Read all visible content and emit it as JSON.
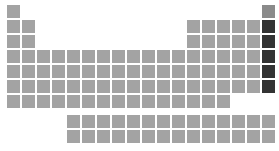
{
  "grid": {
    "origin_x": 7,
    "origin_y": 5,
    "pitch": 15,
    "f_origin_x": 67,
    "f_origin_y": 115,
    "colors": {
      "default": "#a3a3a3",
      "helium": "#8a8a8a",
      "noble": "#333333"
    },
    "rows": [
      {
        "period": 1,
        "cols": [
          1,
          18
        ]
      },
      {
        "period": 2,
        "cols": [
          1,
          2,
          13,
          14,
          15,
          16,
          17,
          18
        ]
      },
      {
        "period": 3,
        "cols": [
          1,
          2,
          13,
          14,
          15,
          16,
          17,
          18
        ]
      },
      {
        "period": 4,
        "cols": [
          1,
          2,
          3,
          4,
          5,
          6,
          7,
          8,
          9,
          10,
          11,
          12,
          13,
          14,
          15,
          16,
          17,
          18
        ]
      },
      {
        "period": 5,
        "cols": [
          1,
          2,
          3,
          4,
          5,
          6,
          7,
          8,
          9,
          10,
          11,
          12,
          13,
          14,
          15,
          16,
          17,
          18
        ]
      },
      {
        "period": 6,
        "cols": [
          1,
          2,
          3,
          4,
          5,
          6,
          7,
          8,
          9,
          10,
          11,
          12,
          13,
          14,
          15,
          16,
          17,
          18
        ]
      },
      {
        "period": 7,
        "cols": [
          1,
          2,
          3,
          4,
          5,
          6,
          7,
          8,
          9,
          10,
          11,
          12,
          13,
          14,
          15
        ]
      }
    ],
    "f_rows": [
      14,
      14
    ]
  }
}
